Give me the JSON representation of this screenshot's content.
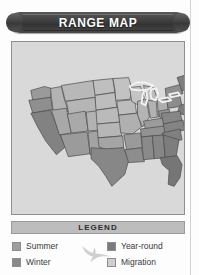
{
  "page": {
    "background_color": "#fdfdfd",
    "rule_color": "#d2d2d2"
  },
  "banner": {
    "title": "RANGE MAP",
    "background_color": "#3f3f3f",
    "text_color": "#ffffff"
  },
  "map": {
    "panel_background": "#d9d9d9",
    "border_color": "#8f8f8f",
    "region_label": "United States range map",
    "outline_color": "#4a4a4a",
    "lakes_color": "#f2f2f2",
    "shades": {
      "summer": "#9e9e9e",
      "winter": "#7a7a7a",
      "year_round": "#6b6b6b",
      "migration": "#c6c6c6"
    }
  },
  "legend": {
    "title": "LEGEND",
    "bar_color": "#bdbdbd",
    "items": [
      {
        "label": "Summer",
        "color": "#9e9e9e"
      },
      {
        "label": "Winter",
        "color": "#8a8a8a"
      },
      {
        "label": "Year-round",
        "color": "#7b7b7b"
      },
      {
        "label": "Migration",
        "color": "#cfcfcf"
      }
    ],
    "bird_icon": "bird-silhouette",
    "bird_color": "#cfcfcf"
  }
}
